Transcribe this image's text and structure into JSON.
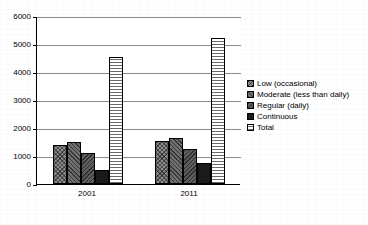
{
  "chart_data": {
    "type": "bar",
    "title": "",
    "xlabel": "",
    "ylabel": "",
    "categories": [
      "2001",
      "2011"
    ],
    "ylim": [
      0,
      6000
    ],
    "yticks": [
      0,
      1000,
      2000,
      3000,
      4000,
      5000,
      6000
    ],
    "ytick_labels": [
      "0",
      "1000",
      "2000",
      "3000",
      "4000",
      "5000",
      "6000"
    ],
    "grid": true,
    "legend_position": "right",
    "series": [
      {
        "name": "Low (occasional)",
        "pattern": "cross-hatch",
        "values": [
          1400,
          1550
        ]
      },
      {
        "name": "Moderate (less than daily)",
        "pattern": "diagonal-hatch",
        "values": [
          1500,
          1650
        ]
      },
      {
        "name": "Regular (daily)",
        "pattern": "diagonal-hatch-alt",
        "values": [
          1100,
          1250
        ]
      },
      {
        "name": "Continuous",
        "pattern": "solid-black",
        "values": [
          500,
          750
        ]
      },
      {
        "name": "Total",
        "pattern": "horizontal-lines",
        "values": [
          4550,
          5200
        ]
      }
    ]
  },
  "legend": {
    "items": [
      {
        "label": "Low (occasional)"
      },
      {
        "label": "Moderate (less than daily)"
      },
      {
        "label": "Regular (daily)"
      },
      {
        "label": "Continuous"
      },
      {
        "label": "Total"
      }
    ]
  },
  "axes": {
    "y_labels": [
      "6000",
      "5000",
      "4000",
      "3000",
      "2000",
      "1000",
      "0"
    ],
    "x_labels": [
      "2001",
      "2011"
    ]
  },
  "colors": {
    "axis": "#000000",
    "grid": "#8a8a8a",
    "background": "#ffffff",
    "solid_series": "#1a1a1a"
  }
}
